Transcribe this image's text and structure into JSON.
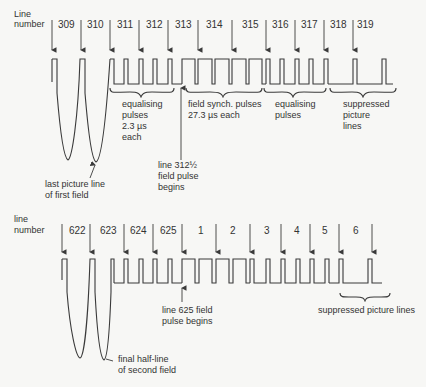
{
  "top": {
    "axis_label_1": "Line",
    "axis_label_2": "number",
    "line_numbers": [
      "309",
      "310",
      "311",
      "312",
      "313",
      "314",
      "315",
      "316",
      "317",
      "318",
      "319"
    ],
    "labels": {
      "equalising_1": [
        "equalising",
        "pulses",
        "2.3 µs",
        "each"
      ],
      "field_synch": [
        "field synch. pulses",
        "27.3 µs each"
      ],
      "equalising_2": [
        "equalising",
        "pulses"
      ],
      "suppressed": [
        "suppressed",
        "picture",
        "lines"
      ],
      "half_line": [
        "line 312½",
        "field pulse",
        "begins"
      ],
      "last_line": [
        "last picture line",
        "of first field"
      ]
    }
  },
  "bottom": {
    "axis_label_1": "line",
    "axis_label_2": "number",
    "line_numbers": [
      "622",
      "623",
      "624",
      "625",
      "1",
      "2",
      "3",
      "4",
      "5",
      "6"
    ],
    "labels": {
      "field_begin": [
        "line 625 field",
        "pulse begins"
      ],
      "suppressed": "suppressed picture lines",
      "final_half": [
        "final half-line",
        "of second field"
      ]
    }
  }
}
